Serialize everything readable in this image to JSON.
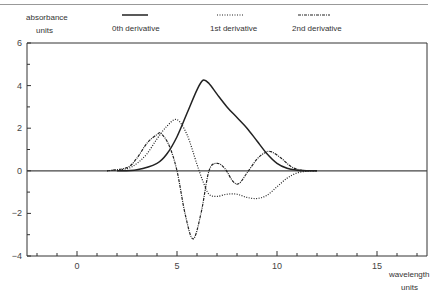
{
  "chart_data": {
    "type": "line",
    "title": "",
    "xlabel": "wavelength units",
    "ylabel": "absorbance units",
    "xlim": [
      -2.5,
      17.5
    ],
    "ylim": [
      -4,
      6
    ],
    "x_ticks": [
      0,
      5,
      10,
      15
    ],
    "y_ticks": [
      -4,
      -2,
      0,
      2,
      4,
      6
    ],
    "grid": false,
    "legend_position": "top",
    "series": [
      {
        "name": "0th derivative",
        "style": "solid",
        "x": [
          2,
          3,
          4,
          4.5,
          5,
          5.5,
          6,
          6.3,
          6.6,
          7,
          7.5,
          8,
          8.5,
          9,
          9.5,
          10,
          10.5,
          11,
          11.5,
          12
        ],
        "y": [
          0,
          0.05,
          0.35,
          0.8,
          1.6,
          2.7,
          3.8,
          4.25,
          4.1,
          3.6,
          3.0,
          2.5,
          2.0,
          1.4,
          0.8,
          0.35,
          0.12,
          0.03,
          0,
          0
        ]
      },
      {
        "name": "1st derivative",
        "style": "dotted",
        "x": [
          1.5,
          2.5,
          3,
          3.5,
          4,
          4.5,
          5,
          5.5,
          6,
          6.3,
          6.6,
          7,
          7.5,
          8,
          8.5,
          9,
          9.5,
          10,
          10.5,
          11,
          11.5,
          12
        ],
        "y": [
          0,
          0.1,
          0.35,
          0.8,
          1.5,
          2.1,
          2.4,
          1.7,
          0.3,
          -0.5,
          -1.1,
          -1.2,
          -1.1,
          -1.1,
          -1.25,
          -1.3,
          -1.15,
          -0.75,
          -0.35,
          -0.1,
          -0.02,
          0
        ]
      },
      {
        "name": "2nd derivative",
        "style": "dash-dot",
        "x": [
          1.5,
          2.5,
          3,
          3.5,
          4,
          4.2,
          4.6,
          5,
          5.4,
          5.8,
          6.2,
          6.6,
          7,
          7.4,
          7.8,
          8.1,
          8.5,
          9,
          9.4,
          9.7,
          10.2,
          10.7,
          11.2,
          12
        ],
        "y": [
          0,
          0.15,
          0.6,
          1.3,
          1.7,
          1.75,
          1.2,
          0,
          -2.0,
          -3.2,
          -2.0,
          0,
          0.35,
          0.1,
          -0.5,
          -0.6,
          -0.1,
          0.55,
          0.85,
          0.9,
          0.6,
          0.2,
          0.03,
          0
        ]
      }
    ],
    "annotations": []
  },
  "axis": {
    "y_label_line1": "absorbance",
    "y_label_line2": "units",
    "x_label_line1": "wavelength",
    "x_label_line2": "units",
    "x_tick_labels": [
      "0",
      "5",
      "10",
      "15"
    ],
    "y_tick_labels": [
      "6",
      "4",
      "2",
      "0",
      "−2",
      "−4"
    ]
  },
  "legend": {
    "items": [
      {
        "label": "0th derivative"
      },
      {
        "label": "1st derivative"
      },
      {
        "label": "2nd derivative"
      }
    ]
  }
}
